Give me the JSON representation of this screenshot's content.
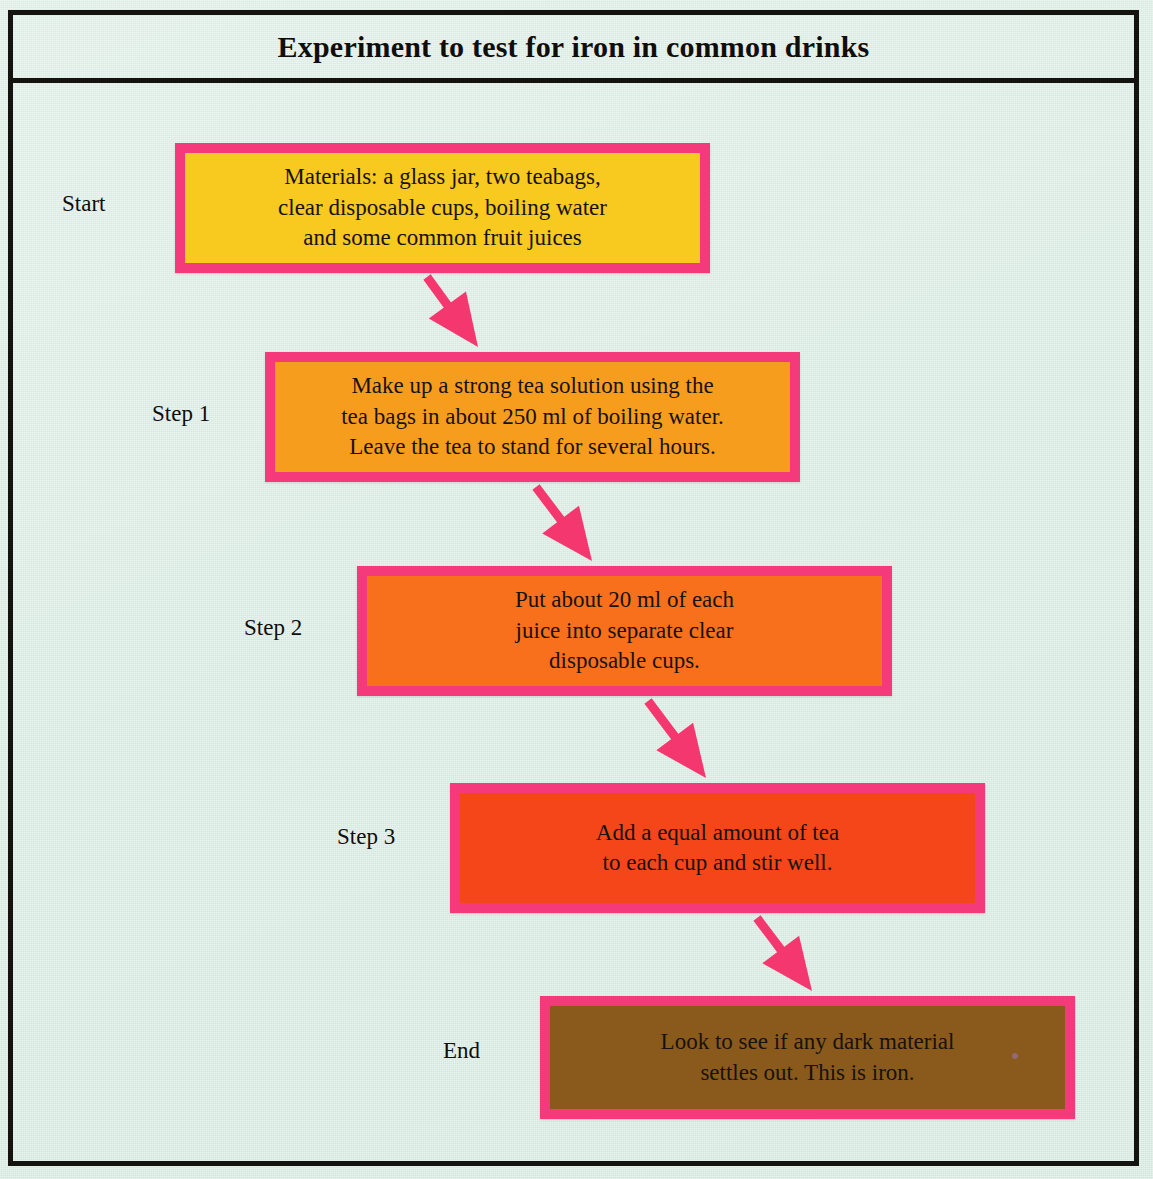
{
  "page": {
    "title": "Experiment to test for iron in common drinks",
    "background_color": "#dceee6",
    "frame_color": "#15130f"
  },
  "colors": {
    "border_pink": "#f53a7b",
    "arrow_pink": "#f4386f",
    "text_dark": "#17120d",
    "box_fill_start": "#f8c91f",
    "box_fill_step1": "#f79d1e",
    "box_fill_step2": "#f8701c",
    "box_fill_step3": "#f5461a",
    "box_fill_end": "#8a5a1c"
  },
  "flowchart": {
    "type": "vertical-cascade-flowchart",
    "step_count": 5,
    "steps": [
      {
        "label": "Start",
        "text": "Materials: a glass jar, two teabags,\nclear disposable cups, boiling water\nand some common fruit juices",
        "fill": "#f8c91f",
        "box": {
          "x": 175,
          "y": 143,
          "w": 535,
          "h": 130
        },
        "label_pos": {
          "x": 62,
          "y": 191
        }
      },
      {
        "label": "Step 1",
        "text": "Make up a strong tea solution using the\ntea bags in about 250 ml of boiling water.\nLeave the tea to stand for several hours.",
        "fill": "#f79d1e",
        "box": {
          "x": 265,
          "y": 352,
          "w": 535,
          "h": 130
        },
        "label_pos": {
          "x": 152,
          "y": 401
        }
      },
      {
        "label": "Step 2",
        "text": "Put about 20 ml of each\njuice into separate clear\ndisposable cups.",
        "fill": "#f8701c",
        "box": {
          "x": 357,
          "y": 566,
          "w": 535,
          "h": 130
        },
        "label_pos": {
          "x": 244,
          "y": 615
        }
      },
      {
        "label": "Step 3",
        "text": "Add a equal amount of tea\nto each cup and stir well.",
        "fill": "#f5461a",
        "box": {
          "x": 450,
          "y": 783,
          "w": 535,
          "h": 130
        },
        "label_pos": {
          "x": 337,
          "y": 824
        }
      },
      {
        "label": "End",
        "text": "Look to see if any dark material\nsettles out. This is iron.",
        "fill": "#8a5a1c",
        "box": {
          "x": 540,
          "y": 996,
          "w": 535,
          "h": 123
        },
        "label_pos": {
          "x": 443,
          "y": 1038
        }
      }
    ],
    "arrows": [
      {
        "from": "Start",
        "to": "Step 1",
        "x1": 427,
        "y1": 277,
        "x2": 478,
        "y2": 347
      },
      {
        "from": "Step 1",
        "to": "Step 2",
        "x1": 536,
        "y1": 487,
        "x2": 592,
        "y2": 561
      },
      {
        "from": "Step 2",
        "to": "Step 3",
        "x1": 648,
        "y1": 701,
        "x2": 706,
        "y2": 778
      },
      {
        "from": "Step 3",
        "to": "End",
        "x1": 757,
        "y1": 918,
        "x2": 812,
        "y2": 991
      }
    ]
  }
}
